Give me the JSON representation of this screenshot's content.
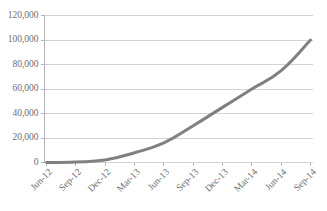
{
  "chart_data": {
    "type": "line",
    "title": "",
    "subtitle": "",
    "xlabel": "",
    "ylabel": "",
    "categories": [
      "Jun-12",
      "Sep-12",
      "Dec-12",
      "Mar-13",
      "Jun-13",
      "Sep-13",
      "Dec-13",
      "Mar-14",
      "Jun-14",
      "Sep-14"
    ],
    "series": [
      {
        "name": "",
        "color": "#808080",
        "values": [
          0,
          500,
          2000,
          8000,
          16000,
          30000,
          45000,
          60000,
          75000,
          100000
        ]
      }
    ],
    "ylim": [
      0,
      120000
    ],
    "ytick_values": [
      0,
      20000,
      40000,
      60000,
      80000,
      100000,
      120000
    ],
    "ytick_labels": [
      "0",
      "20,000",
      "40,000",
      "60,000",
      "80,000",
      "100,000",
      "120,000"
    ],
    "grid": true,
    "grid_axis": "y",
    "legend": false,
    "legend_position": "none",
    "xtick_rotation": 45
  },
  "style": {
    "background": "#ffffff",
    "line_color": "#808080",
    "gridline_color": "#d3d3d3",
    "axis_color": "#b4b4b4",
    "label_color": "#6e6e6e",
    "line_width": 3
  }
}
